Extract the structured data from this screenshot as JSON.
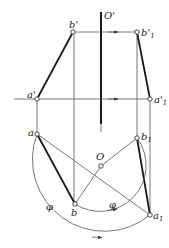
{
  "diagram": {
    "type": "descriptive-geometry-rotation",
    "axis_label": "O'",
    "center_label": "O",
    "angle_label": "φ",
    "points": {
      "a_prime": {
        "label": "a'",
        "x": 37,
        "y": 99
      },
      "b_prime": {
        "label": "b'",
        "x": 73,
        "y": 32
      },
      "a1_prime": {
        "label": "a'",
        "sub": "1",
        "x": 150,
        "y": 99
      },
      "b1_prime": {
        "label": "b'",
        "sub": "1",
        "x": 137,
        "y": 32
      },
      "a": {
        "label": "a",
        "x": 37,
        "y": 134
      },
      "b": {
        "label": "b",
        "x": 75,
        "y": 204
      },
      "O": {
        "label": "O",
        "x": 101,
        "y": 166
      },
      "a1": {
        "label": "a",
        "sub": "1",
        "x": 150,
        "y": 215
      },
      "b1": {
        "label": "b",
        "sub": "1",
        "x": 137,
        "y": 138
      }
    },
    "angle_labels": [
      "φ",
      "φ"
    ]
  }
}
